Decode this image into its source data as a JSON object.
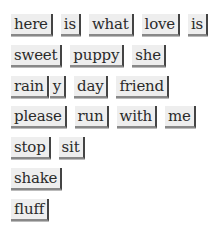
{
  "rows": [
    {
      "tiles": [
        "here",
        "is",
        "what",
        "love",
        "is"
      ]
    },
    {
      "tiles": [
        "sweet",
        "puppy",
        "she"
      ]
    },
    {
      "tiles": [
        "rain",
        "y",
        "day",
        "friend"
      ]
    },
    {
      "tiles": [
        "please",
        "run",
        "with",
        "me"
      ]
    },
    {
      "tiles": [
        "stop",
        "sit"
      ]
    },
    {
      "tiles": [
        "shake"
      ]
    },
    {
      "tiles": [
        "fluff"
      ]
    }
  ]
}
